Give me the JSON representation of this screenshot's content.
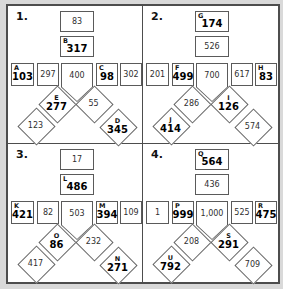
{
  "page": {
    "background_color": "#d9d9d9",
    "sheet_color": "#ffffff",
    "border_color": "#4d4d4d",
    "answer_color": "#000000",
    "plain_value_color": "#2f2f2f"
  },
  "puzzles": [
    {
      "label": "1.",
      "shapes": {
        "top": {
          "letter": "",
          "value": "83"
        },
        "second": {
          "letter": "B",
          "value": "317"
        },
        "r1": {
          "letter": "A",
          "value": "103"
        },
        "r2": {
          "letter": "",
          "value": "297"
        },
        "pent": {
          "letter": "",
          "value": "400"
        },
        "r4": {
          "letter": "C",
          "value": "98"
        },
        "r5": {
          "letter": "",
          "value": "302"
        },
        "dul": {
          "letter": "E",
          "value": "277"
        },
        "dur": {
          "letter": "",
          "value": "55"
        },
        "dll": {
          "letter": "",
          "value": "123"
        },
        "dlr": {
          "letter": "D",
          "value": "345"
        }
      }
    },
    {
      "label": "2.",
      "shapes": {
        "top": {
          "letter": "G",
          "value": "174"
        },
        "second": {
          "letter": "",
          "value": "526"
        },
        "r1": {
          "letter": "",
          "value": "201"
        },
        "r2": {
          "letter": "F",
          "value": "499"
        },
        "pent": {
          "letter": "",
          "value": "700"
        },
        "r4": {
          "letter": "",
          "value": "617"
        },
        "r5": {
          "letter": "H",
          "value": "83"
        },
        "dul": {
          "letter": "",
          "value": "286"
        },
        "dur": {
          "letter": "I",
          "value": "126"
        },
        "dll": {
          "letter": "J",
          "value": "414"
        },
        "dlr": {
          "letter": "",
          "value": "574"
        }
      }
    },
    {
      "label": "3.",
      "shapes": {
        "top": {
          "letter": "",
          "value": "17"
        },
        "second": {
          "letter": "L",
          "value": "486"
        },
        "r1": {
          "letter": "K",
          "value": "421"
        },
        "r2": {
          "letter": "",
          "value": "82"
        },
        "pent": {
          "letter": "",
          "value": "503"
        },
        "r4": {
          "letter": "M",
          "value": "394"
        },
        "r5": {
          "letter": "",
          "value": "109"
        },
        "dul": {
          "letter": "O",
          "value": "86"
        },
        "dur": {
          "letter": "",
          "value": "232"
        },
        "dll": {
          "letter": "",
          "value": "417"
        },
        "dlr": {
          "letter": "N",
          "value": "271"
        }
      }
    },
    {
      "label": "4.",
      "shapes": {
        "top": {
          "letter": "Q",
          "value": "564"
        },
        "second": {
          "letter": "",
          "value": "436"
        },
        "r1": {
          "letter": "",
          "value": "1"
        },
        "r2": {
          "letter": "P",
          "value": "999"
        },
        "pent": {
          "letter": "",
          "value": "1,000"
        },
        "r4": {
          "letter": "",
          "value": "525"
        },
        "r5": {
          "letter": "R",
          "value": "475"
        },
        "dul": {
          "letter": "",
          "value": "208"
        },
        "dur": {
          "letter": "S",
          "value": "291"
        },
        "dll": {
          "letter": "U",
          "value": "792"
        },
        "dlr": {
          "letter": "",
          "value": "709"
        }
      }
    }
  ]
}
